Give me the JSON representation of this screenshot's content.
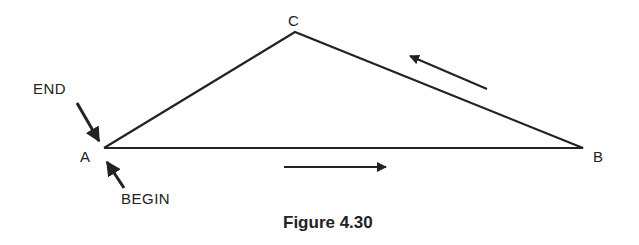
{
  "figure": {
    "caption": "Figure 4.30",
    "vertices": {
      "A": {
        "label": "A",
        "x": 104,
        "y": 148
      },
      "B": {
        "label": "B",
        "x": 583,
        "y": 148
      },
      "C": {
        "label": "C",
        "x": 295,
        "y": 32
      }
    },
    "annotations": {
      "end": "END",
      "begin": "BEGIN"
    },
    "direction_arrows": [
      {
        "from": [
          284,
          167
        ],
        "to": [
          386,
          167
        ],
        "meaning": "A to B"
      },
      {
        "from": [
          487,
          89
        ],
        "to": [
          410,
          56
        ],
        "meaning": "B to C"
      }
    ],
    "colors": {
      "stroke": "#222222",
      "background": "#ffffff"
    }
  }
}
